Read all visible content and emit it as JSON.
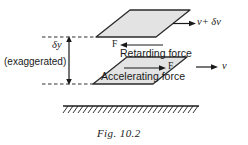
{
  "figure": {
    "caption": "Fig. 10.2",
    "colors": {
      "plane_fill": "#e3e3e3",
      "plane_stroke": "#2b2b2b",
      "line": "#1a1a1a",
      "background": "#ffffff"
    }
  },
  "labels": {
    "velocity_top": "ν+ δν",
    "velocity_bottom": "ν",
    "dimension": "δy",
    "dimension_note": "(exaggerated)",
    "force_top": "F",
    "force_bottom": "F",
    "retarding_force": "Retarding force",
    "accelerating_force": "Accelerating force"
  },
  "elements": {
    "top_plane": "upper-fluid-layer",
    "bottom_plane": "lower-fluid-layer",
    "ground": "hatched-boundary-surface",
    "dimension_arrow": "delta-y-dimension-arrow",
    "velocity_arrow_top": "velocity-arrow-upper",
    "velocity_arrow_bottom": "velocity-arrow-lower",
    "force_arrow_top": "retarding-force-arrow",
    "force_arrow_bottom": "accelerating-force-arrow"
  }
}
